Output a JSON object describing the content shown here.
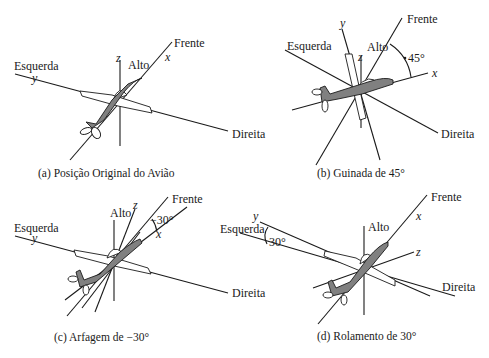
{
  "figure": {
    "panels": [
      {
        "id": "a",
        "caption": "(a) Posição Original do Avião",
        "labels": {
          "left": "Esquerda",
          "right": "Direita",
          "front": "Frente",
          "up": "Alto"
        },
        "axes": {
          "x": "x",
          "y": "y",
          "z": "z"
        },
        "angle": ""
      },
      {
        "id": "b",
        "caption": "(b) Guinada de 45°",
        "labels": {
          "left": "Esquerda",
          "right": "Direita",
          "front": "Frente",
          "up": "Alto"
        },
        "axes": {
          "x": "x",
          "y": "y",
          "z": "z"
        },
        "angle": "45°"
      },
      {
        "id": "c",
        "caption": "(c) Arfagem de −30°",
        "labels": {
          "left": "Esquerda",
          "right": "Direita",
          "front": "Frente",
          "up": "Alto"
        },
        "axes": {
          "x": "x",
          "y": "y",
          "z": "z"
        },
        "angle": "−30°"
      },
      {
        "id": "d",
        "caption": "(d) Rolamento de 30°",
        "labels": {
          "left": "Esquerda",
          "right": "Direita",
          "front": "Frente",
          "up": "Alto"
        },
        "axes": {
          "x": "x",
          "y": "y",
          "z": "z"
        },
        "angle": "30°"
      }
    ],
    "colors": {
      "line": "#1a1a1a",
      "fuselage": "#808080",
      "background": "#ffffff"
    }
  }
}
